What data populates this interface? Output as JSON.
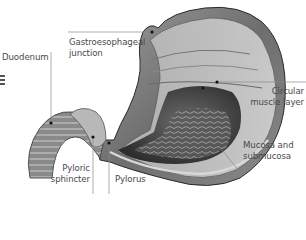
{
  "diagram": {
    "labels": [
      {
        "id": "duodenum",
        "text": "Duodenum"
      },
      {
        "id": "gastroesophageal",
        "text": "Gastroesophageal",
        "text2": "junction"
      },
      {
        "id": "circular",
        "text": "Circular",
        "text2": "muscle layer"
      },
      {
        "id": "mucosa",
        "text": "Mucosa and",
        "text2": "submucosa"
      },
      {
        "id": "pyloric",
        "text": "Pyloric",
        "text2": "sphincter"
      },
      {
        "id": "pylorus",
        "text": "Pylorus"
      }
    ],
    "colors": {
      "background": "#ffffff",
      "label_text": "#4a4a4a",
      "leader_line": "#8a8a8a",
      "tissue_dark": "#3a3a3a",
      "tissue_mid": "#8c8c8c",
      "tissue_light": "#c8c8c8"
    }
  }
}
